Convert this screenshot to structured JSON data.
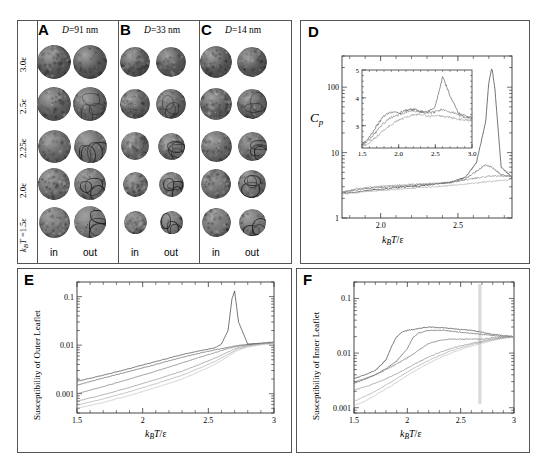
{
  "figure": {
    "panels": [
      "A",
      "B",
      "C",
      "D",
      "E",
      "F"
    ]
  },
  "snapshots": {
    "column_headers": [
      {
        "letter": "A",
        "diameter_label": "D=91 nm",
        "D": "D",
        "rest": "=91 nm"
      },
      {
        "letter": "B",
        "diameter_label": "D=33 nm",
        "D": "D",
        "rest": "=33 nm"
      },
      {
        "letter": "C",
        "diameter_label": "D=14 nm",
        "D": "D",
        "rest": "=14 nm"
      }
    ],
    "row_labels": [
      "3.0ε",
      "2.5ε",
      "2.25ε",
      "2.0ε",
      "k_BT =1.5ε"
    ],
    "row_labels_plain": [
      "3.0e",
      "2.5e",
      "2.25e",
      "2.0e",
      "kBT=1.5e"
    ],
    "bottom_labels": [
      "in",
      "out",
      "in",
      "out",
      "in",
      "out"
    ],
    "sphere_colors": {
      "base_dark": "#4a4a4a",
      "base_mid": "#6b6b6b",
      "base_light": "#8d8d8d",
      "domain_line": "#2a2a2a"
    }
  },
  "panelD": {
    "letter": "D",
    "ylabel": "C_p",
    "ylabel_main": "C",
    "ylabel_sub": "p",
    "xlabel": "k_BT/ε",
    "x_ticks": [
      "2.0",
      "2.5"
    ],
    "y_ticks": [
      "1",
      "10",
      "100"
    ],
    "inset": {
      "x_ticks": [
        "1.5",
        "2.0",
        "2.5",
        "3.0"
      ],
      "y_ticks": [
        "3",
        "4",
        "5"
      ]
    }
  },
  "panelE": {
    "letter": "E",
    "ylabel": "Susceptibility of Outer Leaflet",
    "xlabel": "k_BT/ε",
    "x_ticks": [
      "1.5",
      "2",
      "2.5",
      "3"
    ],
    "y_ticks": [
      "0.001",
      "0.01",
      "0.1"
    ]
  },
  "panelF": {
    "letter": "F",
    "ylabel": "Susceptibility of Inner Leaflet",
    "xlabel": "k_BT/ε",
    "x_ticks": [
      "1.5",
      "2",
      "2.5",
      "3"
    ],
    "y_ticks": [
      "0.001",
      "0.01",
      "0.1"
    ]
  },
  "chart_data": [
    {
      "type": "line",
      "panel": "D",
      "title": "",
      "xlabel": "k_BT/ε",
      "ylabel": "C_p",
      "xlim": [
        1.75,
        2.85
      ],
      "ylim": [
        1,
        300
      ],
      "yscale": "log",
      "xscale": "linear",
      "grid": false,
      "legend": "none",
      "series": [
        {
          "name": "D=91 nm",
          "color": "#3a3a3a",
          "x": [
            1.75,
            1.85,
            1.95,
            2.05,
            2.15,
            2.25,
            2.35,
            2.45,
            2.55,
            2.62,
            2.68,
            2.7,
            2.72,
            2.74,
            2.78,
            2.85
          ],
          "y": [
            2.4,
            2.5,
            2.7,
            2.8,
            3.0,
            3.1,
            3.3,
            3.5,
            4.2,
            7.0,
            30,
            120,
            200,
            90,
            6.0,
            4.2
          ]
        },
        {
          "name": "D=33 nm",
          "color": "#6a6a6a",
          "x": [
            1.75,
            1.85,
            1.95,
            2.05,
            2.15,
            2.25,
            2.35,
            2.45,
            2.55,
            2.62,
            2.68,
            2.72,
            2.78,
            2.85
          ],
          "y": [
            2.5,
            2.7,
            2.9,
            3.0,
            3.1,
            3.2,
            3.3,
            3.5,
            4.0,
            5.2,
            6.5,
            6.0,
            4.6,
            4.3
          ]
        },
        {
          "name": "D=14 nm",
          "color": "#8a8a8a",
          "x": [
            1.75,
            1.85,
            1.95,
            2.05,
            2.15,
            2.25,
            2.35,
            2.45,
            2.55,
            2.65,
            2.72,
            2.8,
            2.85
          ],
          "y": [
            2.5,
            2.8,
            3.0,
            3.1,
            3.2,
            3.3,
            3.4,
            3.5,
            3.8,
            4.2,
            4.4,
            4.4,
            4.3
          ]
        },
        {
          "name": "flat",
          "color": "#a8a8a8",
          "x": [
            1.75,
            1.95,
            2.15,
            2.35,
            2.55,
            2.7,
            2.85
          ],
          "y": [
            2.3,
            2.6,
            2.8,
            3.0,
            3.3,
            3.6,
            3.9
          ]
        }
      ],
      "inset": {
        "type": "line",
        "xlabel": "",
        "ylabel": "",
        "xlim": [
          1.5,
          3.0
        ],
        "ylim": [
          2.2,
          5.0
        ],
        "xticks": [
          1.5,
          2.0,
          2.5,
          3.0
        ],
        "yticks": [
          3,
          4,
          5
        ],
        "series": [
          {
            "name": "s1",
            "color": "#4a4a4a",
            "x": [
              1.5,
              1.6,
              1.7,
              1.8,
              1.9,
              2.0,
              2.1,
              2.2,
              2.3,
              2.4,
              2.5,
              2.6,
              2.7,
              2.8,
              2.9,
              3.0
            ],
            "y": [
              2.3,
              2.6,
              3.0,
              3.35,
              3.5,
              3.45,
              3.55,
              3.6,
              3.5,
              3.5,
              3.7,
              4.75,
              4.1,
              3.5,
              3.35,
              3.3
            ]
          },
          {
            "name": "s2",
            "color": "#7a7a7a",
            "x": [
              1.5,
              1.6,
              1.7,
              1.8,
              1.9,
              2.0,
              2.1,
              2.2,
              2.3,
              2.4,
              2.5,
              2.6,
              2.7,
              2.8,
              2.9,
              3.0
            ],
            "y": [
              2.3,
              2.5,
              2.8,
              3.1,
              3.3,
              3.4,
              3.5,
              3.55,
              3.5,
              3.45,
              3.5,
              3.6,
              3.5,
              3.4,
              3.3,
              3.25
            ]
          },
          {
            "name": "s3",
            "color": "#9a9a9a",
            "x": [
              1.5,
              1.6,
              1.7,
              1.8,
              1.9,
              2.0,
              2.1,
              2.2,
              2.3,
              2.4,
              2.5,
              2.6,
              2.7,
              2.8,
              2.9,
              3.0
            ],
            "y": [
              2.25,
              2.4,
              2.6,
              2.85,
              3.05,
              3.2,
              3.3,
              3.4,
              3.4,
              3.35,
              3.35,
              3.35,
              3.3,
              3.25,
              3.2,
              3.2
            ]
          }
        ]
      }
    },
    {
      "type": "line",
      "panel": "E",
      "title": "",
      "xlabel": "k_BT/ε",
      "ylabel": "Susceptibility of Outer Leaflet",
      "xlim": [
        1.5,
        3.0
      ],
      "ylim": [
        0.0004,
        0.2
      ],
      "yscale": "log",
      "grid": false,
      "legend": "none",
      "series": [
        {
          "name": "c1",
          "color": "#3a3a3a",
          "x": [
            1.5,
            1.7,
            1.9,
            2.1,
            2.3,
            2.45,
            2.55,
            2.6,
            2.65,
            2.68,
            2.7,
            2.73,
            2.8,
            2.9,
            3.0
          ],
          "y": [
            0.0018,
            0.0024,
            0.0033,
            0.0046,
            0.0064,
            0.0078,
            0.0088,
            0.0105,
            0.02,
            0.09,
            0.13,
            0.03,
            0.0105,
            0.011,
            0.0115
          ]
        },
        {
          "name": "c2",
          "color": "#5a5a5a",
          "x": [
            1.5,
            1.7,
            1.9,
            2.1,
            2.3,
            2.45,
            2.55,
            2.65,
            2.72,
            2.8,
            2.9,
            3.0
          ],
          "y": [
            0.0015,
            0.0021,
            0.0029,
            0.004,
            0.0056,
            0.007,
            0.008,
            0.009,
            0.0098,
            0.0103,
            0.0108,
            0.0112
          ]
        },
        {
          "name": "c3",
          "color": "#6e6e6e",
          "x": [
            1.5,
            1.7,
            1.9,
            2.1,
            2.3,
            2.45,
            2.55,
            2.65,
            2.72,
            2.8,
            2.9,
            3.0
          ],
          "y": [
            0.001,
            0.0014,
            0.002,
            0.0029,
            0.0043,
            0.0058,
            0.007,
            0.0085,
            0.0095,
            0.0102,
            0.0108,
            0.0113
          ]
        },
        {
          "name": "c4",
          "color": "#8a8a8a",
          "x": [
            1.5,
            1.7,
            1.9,
            2.1,
            2.3,
            2.45,
            2.55,
            2.65,
            2.72,
            2.8,
            2.9,
            3.0
          ],
          "y": [
            0.0007,
            0.00095,
            0.00135,
            0.00195,
            0.0029,
            0.0042,
            0.0054,
            0.0072,
            0.0088,
            0.0098,
            0.0106,
            0.0112
          ]
        },
        {
          "name": "c5",
          "color": "#a5a5a5",
          "x": [
            1.5,
            1.7,
            1.9,
            2.1,
            2.3,
            2.45,
            2.55,
            2.65,
            2.72,
            2.8,
            2.9,
            3.0
          ],
          "y": [
            0.00058,
            0.00078,
            0.0011,
            0.0016,
            0.0024,
            0.0035,
            0.0046,
            0.0064,
            0.0082,
            0.0095,
            0.0104,
            0.011
          ]
        },
        {
          "name": "c6",
          "color": "#bdbdbd",
          "x": [
            1.5,
            1.7,
            1.9,
            2.1,
            2.3,
            2.45,
            2.55,
            2.65,
            2.72,
            2.8,
            2.9,
            3.0
          ],
          "y": [
            0.0005,
            0.00066,
            0.00092,
            0.00134,
            0.002,
            0.003,
            0.004,
            0.0058,
            0.0078,
            0.0092,
            0.0102,
            0.0109
          ]
        }
      ]
    },
    {
      "type": "line",
      "panel": "F",
      "title": "",
      "xlabel": "k_BT/ε",
      "ylabel": "Susceptibility of Inner Leaflet",
      "xlim": [
        1.5,
        3.0
      ],
      "ylim": [
        0.0008,
        0.2
      ],
      "yscale": "log",
      "grid": false,
      "legend": "none",
      "series": [
        {
          "name": "c1",
          "color": "#3a3a3a",
          "x": [
            1.5,
            1.6,
            1.7,
            1.8,
            1.85,
            1.9,
            1.95,
            2.0,
            2.1,
            2.2,
            2.35,
            2.5,
            2.6,
            2.7,
            2.8,
            2.9,
            3.0
          ],
          "y": [
            0.0034,
            0.004,
            0.0048,
            0.0075,
            0.013,
            0.02,
            0.024,
            0.026,
            0.028,
            0.03,
            0.029,
            0.027,
            0.026,
            0.024,
            0.022,
            0.021,
            0.02
          ]
        },
        {
          "name": "c2",
          "color": "#5a5a5a",
          "x": [
            1.5,
            1.6,
            1.7,
            1.8,
            1.9,
            2.0,
            2.05,
            2.1,
            2.2,
            2.35,
            2.5,
            2.6,
            2.7,
            2.8,
            2.9,
            3.0
          ],
          "y": [
            0.0028,
            0.0033,
            0.004,
            0.0052,
            0.0072,
            0.012,
            0.019,
            0.023,
            0.026,
            0.026,
            0.024,
            0.023,
            0.022,
            0.021,
            0.02,
            0.02
          ]
        },
        {
          "name": "c3",
          "color": "#6e6e6e",
          "x": [
            1.5,
            1.6,
            1.7,
            1.8,
            1.9,
            2.0,
            2.1,
            2.2,
            2.3,
            2.4,
            2.5,
            2.6,
            2.7,
            2.8,
            2.9,
            3.0
          ],
          "y": [
            0.003,
            0.0034,
            0.004,
            0.005,
            0.0063,
            0.0082,
            0.011,
            0.015,
            0.017,
            0.018,
            0.018,
            0.018,
            0.018,
            0.019,
            0.019,
            0.02
          ]
        },
        {
          "name": "c4",
          "color": "#8a8a8a",
          "x": [
            1.5,
            1.6,
            1.7,
            1.8,
            1.9,
            2.0,
            2.1,
            2.2,
            2.3,
            2.4,
            2.5,
            2.6,
            2.7,
            2.8,
            2.9,
            3.0
          ],
          "y": [
            0.0021,
            0.0024,
            0.0028,
            0.0034,
            0.0042,
            0.0053,
            0.0068,
            0.0084,
            0.0102,
            0.012,
            0.0135,
            0.015,
            0.0165,
            0.018,
            0.0192,
            0.02
          ]
        },
        {
          "name": "c5",
          "color": "#a5a5a5",
          "x": [
            1.5,
            1.6,
            1.7,
            1.8,
            1.9,
            2.0,
            2.1,
            2.2,
            2.3,
            2.4,
            2.5,
            2.6,
            2.7,
            2.8,
            2.9,
            3.0
          ],
          "y": [
            0.0013,
            0.0016,
            0.002,
            0.0026,
            0.0034,
            0.0045,
            0.0058,
            0.0073,
            0.009,
            0.0108,
            0.0125,
            0.0142,
            0.0158,
            0.0175,
            0.019,
            0.02
          ]
        },
        {
          "name": "c6",
          "color": "#bdbdbd",
          "x": [
            1.5,
            1.6,
            1.7,
            1.8,
            1.9,
            2.0,
            2.1,
            2.2,
            2.3,
            2.4,
            2.5,
            2.6,
            2.7,
            2.8,
            2.9,
            3.0
          ],
          "y": [
            0.0011,
            0.0013,
            0.0017,
            0.0022,
            0.0029,
            0.0039,
            0.0051,
            0.0065,
            0.0081,
            0.0098,
            0.0116,
            0.0134,
            0.0152,
            0.017,
            0.0186,
            0.0198
          ]
        }
      ]
    }
  ]
}
